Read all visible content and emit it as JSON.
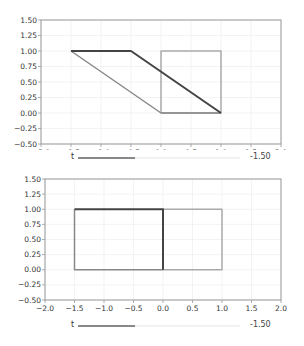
{
  "chart_data": [
    {
      "type": "line",
      "title": "",
      "xlabel": "",
      "ylabel": "",
      "xlim": [
        -2.0,
        2.0
      ],
      "ylim": [
        -0.5,
        1.5
      ],
      "grid": true,
      "xticks": [
        "−2.0",
        "−1.5",
        "−1.0",
        "−0.5",
        "0.0",
        "0.5",
        "1.0",
        "1.5",
        "2.0"
      ],
      "yticks": [
        "1.50",
        "1.25",
        "1.00",
        "0.75",
        "0.50",
        "0.25",
        "0.00",
        "−0.25",
        "−0.50"
      ],
      "series": [
        {
          "name": "reference-square",
          "color": "#aaaaaa",
          "x": [
            0,
            1,
            1,
            0,
            0
          ],
          "y": [
            0,
            0,
            1,
            1,
            0
          ]
        },
        {
          "name": "shape-gray",
          "color": "#888888",
          "x": [
            -1.5,
            0,
            1
          ],
          "y": [
            1,
            0,
            0
          ]
        },
        {
          "name": "shape-dark",
          "color": "#444444",
          "x": [
            -1.5,
            -0.5,
            1
          ],
          "y": [
            1,
            1,
            0
          ]
        }
      ],
      "slider": {
        "label": "t",
        "value": "-1.50",
        "fraction": 0.35
      }
    },
    {
      "type": "line",
      "title": "",
      "xlabel": "",
      "ylabel": "",
      "xlim": [
        -2.0,
        2.0
      ],
      "ylim": [
        -0.5,
        1.5
      ],
      "grid": true,
      "xticks": [
        "−2.0",
        "−1.5",
        "−1.0",
        "−0.5",
        "0.0",
        "0.5",
        "1.0",
        "1.5",
        "2.0"
      ],
      "yticks": [
        "1.50",
        "1.25",
        "1.00",
        "0.75",
        "0.50",
        "0.25",
        "0.00",
        "−0.25",
        "−0.50"
      ],
      "series": [
        {
          "name": "reference-square",
          "color": "#aaaaaa",
          "x": [
            0,
            1,
            1,
            0,
            0
          ],
          "y": [
            0,
            0,
            1,
            1,
            0
          ]
        },
        {
          "name": "shape-gray",
          "color": "#888888",
          "x": [
            -1.5,
            -1.5,
            0
          ],
          "y": [
            1,
            0,
            0
          ]
        },
        {
          "name": "shape-dark",
          "color": "#444444",
          "x": [
            -1.5,
            0,
            0
          ],
          "y": [
            1,
            1,
            0
          ]
        }
      ],
      "slider": {
        "label": "t",
        "value": "-1.50",
        "fraction": 0.35
      }
    }
  ]
}
